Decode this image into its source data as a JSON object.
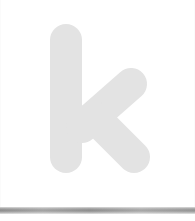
{
  "canvas": {
    "width": 195,
    "height": 221,
    "background_color": "#ffffff"
  },
  "logo": {
    "glyph_name": "k-logo-mark",
    "letter": "k",
    "case": "lowercase",
    "style": "rounded-terminal sans-serif wordmark letter",
    "fill_color": "#e3e3e3",
    "stroke_cap": "round",
    "bounds": {
      "x": 50,
      "y": 24,
      "width": 99,
      "height": 149
    },
    "stem": {
      "x1": 66,
      "y1": 40,
      "x2": 66,
      "y2": 157,
      "thickness": 32
    },
    "upper_arm": {
      "x1": 131,
      "y1": 84,
      "x2": 80,
      "y2": 128,
      "thickness": 31
    },
    "lower_arm": {
      "x1": 92,
      "y1": 116,
      "x2": 136,
      "y2": 157,
      "thickness": 31
    }
  },
  "decor": {
    "edge_rule_color": "#fbfbfb",
    "bottom_band": {
      "name": "bottom-gray-band",
      "top": 207,
      "height": 7,
      "color_dark": "#8d8d8d",
      "color_light": "#e8e8e8"
    }
  }
}
